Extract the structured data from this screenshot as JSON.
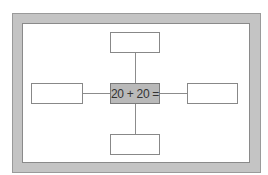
{
  "diagram": {
    "type": "spider-map",
    "center": {
      "label": "20 + 20 ="
    },
    "branches": [
      {
        "position": "top",
        "label": ""
      },
      {
        "position": "left",
        "label": ""
      },
      {
        "position": "right",
        "label": ""
      },
      {
        "position": "bottom",
        "label": ""
      }
    ]
  },
  "colors": {
    "frame": "#c4c4c4",
    "center_fill": "#b9b9b9",
    "box_fill": "#ffffff",
    "line": "#8c8c8c"
  }
}
